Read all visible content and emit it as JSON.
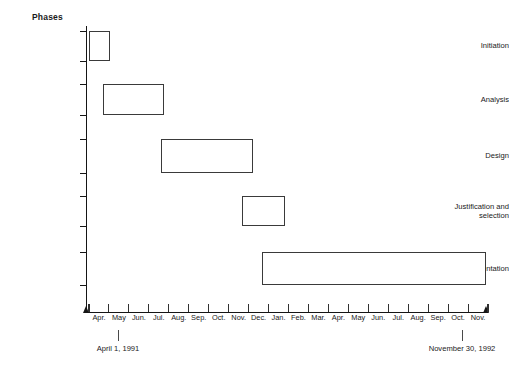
{
  "chart_data": {
    "type": "bar",
    "subtype": "gantt",
    "title": "",
    "ylabel": "Phases",
    "xlabel": "",
    "grid": false,
    "legend": null,
    "axis_start_label": "April 1, 1991",
    "axis_end_label": "November 30, 1992",
    "categories": [
      "Initiation",
      "Analysis",
      "Design",
      "Justification and\nselection",
      "Implementation"
    ],
    "x_ticklabels": [
      "Apr.",
      "May",
      "Jun.",
      "Jul.",
      "Aug.",
      "Sep.",
      "Oct.",
      "Nov.",
      "Dec.",
      "Jan.",
      "Feb.",
      "Mar.",
      "Apr.",
      "May",
      "Jun.",
      "Jul.",
      "Aug.",
      "Sep.",
      "Oct.",
      "Nov."
    ],
    "xlim": [
      0,
      20
    ],
    "bars": [
      {
        "task": "Initiation",
        "start_month": "Apr. 1991",
        "end_month": "May 1991",
        "start": 0.0,
        "end": 1.05
      },
      {
        "task": "Analysis",
        "start_month": "May 1991",
        "end_month": "Aug. 1991",
        "start": 0.7,
        "end": 3.75
      },
      {
        "task": "Design",
        "start_month": "Aug. 1991",
        "end_month": "Dec. 1991",
        "start": 3.6,
        "end": 8.2
      },
      {
        "task": "Justification and selection",
        "start_month": "Nov. 1991",
        "end_month": "Jan. 1992",
        "start": 7.65,
        "end": 9.8
      },
      {
        "task": "Implementation",
        "start_month": "Dec. 1991",
        "end_month": "Nov. 1992",
        "start": 8.65,
        "end": 19.9
      }
    ]
  },
  "colors": {
    "background": "#ffffff",
    "axis": "#151515",
    "bar_stroke": "#3a3a3a",
    "bar_fill": "#ffffff",
    "text": "#1a1a1a"
  }
}
